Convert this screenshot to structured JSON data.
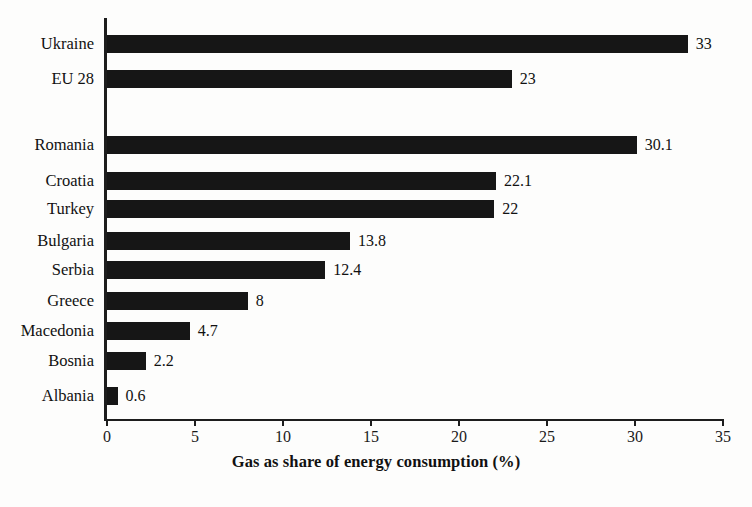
{
  "chart_data": {
    "type": "bar",
    "orientation": "horizontal",
    "title": "",
    "xlabel": "Gas as share of energy consumption (%)",
    "ylabel": "",
    "xlim": [
      0,
      35
    ],
    "xticks": [
      0,
      5,
      10,
      15,
      20,
      25,
      30,
      35
    ],
    "xtick_labels": [
      "0",
      "5",
      "10",
      "15",
      "20",
      "25",
      "30",
      "35"
    ],
    "grid": false,
    "legend": false,
    "bar_color": "#161616",
    "background_color": "#fdfdfc",
    "categories": [
      "Ukraine",
      "EU 28",
      "Romania",
      "Croatia",
      "Turkey",
      "Bulgaria",
      "Serbia",
      "Greece",
      "Macedonia",
      "Bosnia",
      "Albania"
    ],
    "values": [
      33,
      23,
      30.1,
      22.1,
      22,
      13.8,
      12.4,
      8,
      4.7,
      2.2,
      0.6
    ],
    "value_labels": [
      "33",
      "23",
      "30.1",
      "22.1",
      "22",
      "13.8",
      "12.4",
      "8",
      "4.7",
      "2.2",
      "0.6"
    ],
    "rows": [
      {
        "label": "Ukraine",
        "value": 33,
        "value_label": "33",
        "top": 35,
        "spacer_after": false
      },
      {
        "label": "EU 28",
        "value": 23,
        "value_label": "23",
        "top": 70,
        "spacer_after": true
      },
      {
        "label": "Romania",
        "value": 30.1,
        "value_label": "30.1",
        "top": 136,
        "spacer_after": false
      },
      {
        "label": "Croatia",
        "value": 22.1,
        "value_label": "22.1",
        "top": 172,
        "spacer_after": false
      },
      {
        "label": "Turkey",
        "value": 22,
        "value_label": "22",
        "top": 200,
        "spacer_after": false
      },
      {
        "label": "Bulgaria",
        "value": 13.8,
        "value_label": "13.8",
        "top": 232,
        "spacer_after": false
      },
      {
        "label": "Serbia",
        "value": 12.4,
        "value_label": "12.4",
        "top": 261,
        "spacer_after": false
      },
      {
        "label": "Greece",
        "value": 8,
        "value_label": "8",
        "top": 292,
        "spacer_after": false
      },
      {
        "label": "Macedonia",
        "value": 4.7,
        "value_label": "4.7",
        "top": 322,
        "spacer_after": false
      },
      {
        "label": "Bosnia",
        "value": 2.2,
        "value_label": "2.2",
        "top": 352,
        "spacer_after": false
      },
      {
        "label": "Albania",
        "value": 0.6,
        "value_label": "0.6",
        "top": 387,
        "spacer_after": false
      }
    ]
  }
}
